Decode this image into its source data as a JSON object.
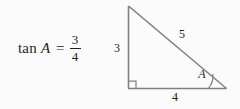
{
  "figure": {
    "background_color": "#fbfbfb",
    "stroke_color": "#7f8083",
    "text_color": "#231f20"
  },
  "equation": {
    "function_name": "tan",
    "variable": "A",
    "relation": "=",
    "fraction": {
      "numerator": "3",
      "denominator": "4"
    }
  },
  "triangle": {
    "vertices": {
      "apex": {
        "x": 128,
        "y": 6
      },
      "right_angle": {
        "x": 128,
        "y": 88
      },
      "angle_a": {
        "x": 226,
        "y": 88
      }
    },
    "labels": {
      "opposite_leg": "3",
      "adjacent_leg": "4",
      "hypotenuse": "5",
      "angle": "A"
    },
    "markers": {
      "right_angle_symbol": "square",
      "angle_arc": "arc"
    }
  }
}
